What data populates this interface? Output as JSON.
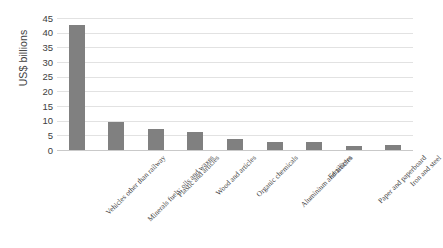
{
  "chart_data": {
    "type": "bar",
    "title": "",
    "subtitle": "",
    "xlabel": "",
    "ylabel": "US$ billions",
    "ylim": [
      0,
      45
    ],
    "ytick_step": 5,
    "yticks": [
      45,
      40,
      35,
      30,
      25,
      20,
      15,
      10,
      5,
      0
    ],
    "grid": true,
    "legend": "none",
    "bar_color": "#808080",
    "gridline_color": "#E2E2E2",
    "axis_color": "#C9C9C9",
    "categories": [
      "Vehicles other than railway",
      "Minerals fuels; oils and waxes",
      "Plastic and articles",
      "Wood and articles",
      "Organic chemicals",
      "Aluminium and articles",
      "Fertilizers",
      "Paper and paperboard",
      "Iron and steel"
    ],
    "values": [
      42.5,
      9.6,
      7.0,
      6.0,
      3.8,
      2.8,
      2.6,
      1.4,
      1.8
    ]
  }
}
